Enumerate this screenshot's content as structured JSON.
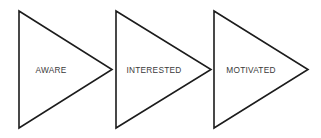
{
  "diagram": {
    "type": "chevron-progression",
    "canvas": {
      "width": 321,
      "height": 138,
      "background": "#ffffff"
    },
    "style": {
      "shape": "right-pointing-triangle",
      "stroke_color": "#1c1c1c",
      "stroke_width": 1.6,
      "fill_color": "#ffffff",
      "label_color": "#3a3a3a"
    },
    "stages": [
      {
        "label": "AWARE",
        "order": 1,
        "left_x": 19,
        "tip_x": 112,
        "top_y": 11,
        "bottom_y": 128,
        "label_x": 51,
        "label_y": 70
      },
      {
        "label": "INTERESTED",
        "order": 2,
        "left_x": 116,
        "tip_x": 211,
        "top_y": 11,
        "bottom_y": 128,
        "label_x": 154,
        "label_y": 70
      },
      {
        "label": "MOTIVATED",
        "order": 3,
        "left_x": 214,
        "tip_x": 308,
        "top_y": 11,
        "bottom_y": 128,
        "label_x": 251,
        "label_y": 70
      }
    ]
  }
}
